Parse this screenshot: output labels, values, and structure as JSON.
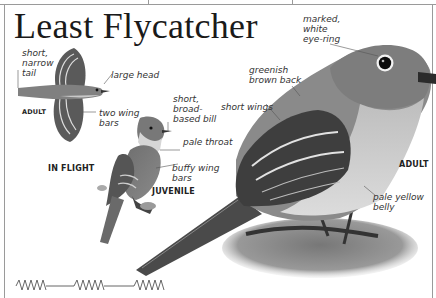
{
  "page": {
    "title": "Least Flycatcher",
    "color_mode": "grayscale"
  },
  "figures": {
    "flight": {
      "tag": "ADULT",
      "caption": "IN FLIGHT",
      "labels": [
        {
          "id": "tail",
          "text": "short,\nnarrow\ntail"
        },
        {
          "id": "head",
          "text": "large head"
        },
        {
          "id": "wingbars",
          "text": "two wing\nbars"
        }
      ]
    },
    "juvenile": {
      "tag": "JUVENILE",
      "labels": [
        {
          "id": "bill",
          "text": "short,\nbroad-\nbased bill"
        },
        {
          "id": "throat",
          "text": "pale throat"
        },
        {
          "id": "wingbars",
          "text": "buffy wing\nbars"
        }
      ]
    },
    "adult": {
      "tag": "ADULT",
      "labels": [
        {
          "id": "eyering",
          "text": "marked,\nwhite\neye-ring"
        },
        {
          "id": "back",
          "text": "greenish\nbrown back"
        },
        {
          "id": "wings",
          "text": "short wings"
        },
        {
          "id": "belly",
          "text": "pale yellow\nbelly"
        }
      ]
    }
  },
  "song_graphic": {
    "description": "song pattern zigzag",
    "groups": 3
  },
  "colors": {
    "frame": "#9a9a9a",
    "text": "#1a1a1a",
    "label": "#333333"
  }
}
